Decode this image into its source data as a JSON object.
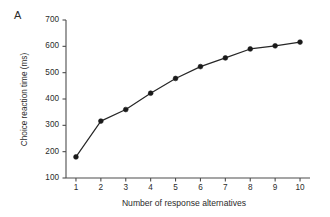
{
  "figure": {
    "panel_label": "A",
    "background_color": "#ffffff",
    "line_color": "#262626",
    "marker_color": "#1a1a1a",
    "axis_color": "#4d4d4d"
  },
  "chart_data": {
    "type": "line",
    "title": "",
    "xlabel": "Number of response alternatives",
    "ylabel": "Choice reaction time (ms)",
    "x": [
      1,
      2,
      3,
      4,
      5,
      6,
      7,
      8,
      9,
      10
    ],
    "values": [
      180,
      316,
      360,
      422,
      478,
      523,
      556,
      590,
      602,
      616
    ],
    "xlim": [
      0.6,
      10.4
    ],
    "ylim": [
      100,
      700
    ],
    "xticks": [
      1,
      2,
      3,
      4,
      5,
      6,
      7,
      8,
      9,
      10
    ],
    "xtick_labels": [
      "1",
      "2",
      "3",
      "4",
      "5",
      "6",
      "7",
      "8",
      "9",
      "10"
    ],
    "yticks": [
      100,
      200,
      300,
      400,
      500,
      600,
      700
    ],
    "ytick_labels": [
      "100",
      "200",
      "300",
      "400",
      "500",
      "600",
      "700"
    ],
    "grid": false,
    "legend": null,
    "marker": "filled-circle",
    "series": [
      {
        "name": "Choice reaction time",
        "values": [
          180,
          316,
          360,
          422,
          478,
          523,
          556,
          590,
          602,
          616
        ]
      }
    ]
  }
}
